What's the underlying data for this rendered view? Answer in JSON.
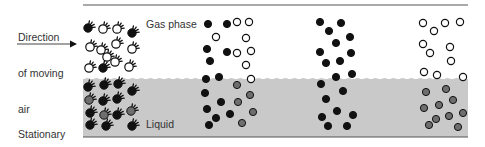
{
  "labels": {
    "direction": [
      "Direction",
      "of moving",
      "air"
    ],
    "stationary": [
      "Stationary",
      "liquid",
      "phase"
    ],
    "gas_phase": "Gas phase",
    "liquid_phase": [
      "Liquid",
      "phase"
    ]
  },
  "colors": {
    "liquid": "#c9c9c9",
    "line": "#555555",
    "filled": "#111111",
    "gray_dot": "#6e6e6e",
    "open_dot": "#ffffff"
  },
  "geometry": {
    "box_left": 83,
    "box_right": 468,
    "top_line_y": 5,
    "bottom_line_y": 137,
    "interface_y": 79
  },
  "columns": [
    {
      "name": "hydrated-molecules",
      "fuzzy": true,
      "dots": [
        {
          "x": 88,
          "y": 28,
          "t": "f"
        },
        {
          "x": 103,
          "y": 29,
          "t": "o"
        },
        {
          "x": 117,
          "y": 29,
          "t": "o"
        },
        {
          "x": 132,
          "y": 33,
          "t": "f"
        },
        {
          "x": 90,
          "y": 47,
          "t": "o"
        },
        {
          "x": 101,
          "y": 50,
          "t": "o"
        },
        {
          "x": 116,
          "y": 44,
          "t": "o"
        },
        {
          "x": 132,
          "y": 49,
          "t": "o"
        },
        {
          "x": 107,
          "y": 57,
          "t": "o"
        },
        {
          "x": 115,
          "y": 62,
          "t": "o"
        },
        {
          "x": 89,
          "y": 68,
          "t": "o"
        },
        {
          "x": 103,
          "y": 68,
          "t": "f"
        },
        {
          "x": 129,
          "y": 67,
          "t": "o"
        },
        {
          "x": 88,
          "y": 87,
          "t": "f"
        },
        {
          "x": 104,
          "y": 85,
          "t": "f"
        },
        {
          "x": 118,
          "y": 84,
          "t": "f"
        },
        {
          "x": 132,
          "y": 91,
          "t": "f"
        },
        {
          "x": 89,
          "y": 100,
          "t": "g"
        },
        {
          "x": 103,
          "y": 101,
          "t": "f"
        },
        {
          "x": 117,
          "y": 99,
          "t": "f"
        },
        {
          "x": 90,
          "y": 113,
          "t": "f"
        },
        {
          "x": 104,
          "y": 115,
          "t": "g"
        },
        {
          "x": 117,
          "y": 115,
          "t": "f"
        },
        {
          "x": 131,
          "y": 111,
          "t": "g"
        },
        {
          "x": 90,
          "y": 125,
          "t": "f"
        },
        {
          "x": 106,
          "y": 126,
          "t": "f"
        },
        {
          "x": 132,
          "y": 126,
          "t": "f"
        }
      ]
    },
    {
      "name": "mixed-column",
      "fuzzy": false,
      "dots": [
        {
          "x": 208,
          "y": 24,
          "t": "f"
        },
        {
          "x": 227,
          "y": 24,
          "t": "f"
        },
        {
          "x": 237,
          "y": 22,
          "t": "o"
        },
        {
          "x": 249,
          "y": 22,
          "t": "o"
        },
        {
          "x": 216,
          "y": 37,
          "t": "o"
        },
        {
          "x": 246,
          "y": 38,
          "t": "o"
        },
        {
          "x": 207,
          "y": 49,
          "t": "f"
        },
        {
          "x": 227,
          "y": 52,
          "t": "f"
        },
        {
          "x": 237,
          "y": 53,
          "t": "o"
        },
        {
          "x": 251,
          "y": 51,
          "t": "o"
        },
        {
          "x": 210,
          "y": 61,
          "t": "f"
        },
        {
          "x": 246,
          "y": 65,
          "t": "o"
        },
        {
          "x": 206,
          "y": 79,
          "t": "f"
        },
        {
          "x": 219,
          "y": 77,
          "t": "f"
        },
        {
          "x": 237,
          "y": 85,
          "t": "g"
        },
        {
          "x": 251,
          "y": 79,
          "t": "o"
        },
        {
          "x": 205,
          "y": 93,
          "t": "f"
        },
        {
          "x": 250,
          "y": 95,
          "t": "g"
        },
        {
          "x": 221,
          "y": 102,
          "t": "f"
        },
        {
          "x": 238,
          "y": 102,
          "t": "g"
        },
        {
          "x": 207,
          "y": 109,
          "t": "f"
        },
        {
          "x": 230,
          "y": 114,
          "t": "f"
        },
        {
          "x": 253,
          "y": 112,
          "t": "g"
        },
        {
          "x": 216,
          "y": 118,
          "t": "f"
        },
        {
          "x": 209,
          "y": 125,
          "t": "f"
        },
        {
          "x": 242,
          "y": 123,
          "t": "g"
        }
      ]
    },
    {
      "name": "filled-column",
      "fuzzy": false,
      "dots": [
        {
          "x": 320,
          "y": 22,
          "t": "f"
        },
        {
          "x": 341,
          "y": 23,
          "t": "f"
        },
        {
          "x": 329,
          "y": 31,
          "t": "f"
        },
        {
          "x": 350,
          "y": 37,
          "t": "f"
        },
        {
          "x": 336,
          "y": 43,
          "t": "f"
        },
        {
          "x": 320,
          "y": 52,
          "t": "f"
        },
        {
          "x": 351,
          "y": 53,
          "t": "f"
        },
        {
          "x": 340,
          "y": 61,
          "t": "f"
        },
        {
          "x": 326,
          "y": 63,
          "t": "f"
        },
        {
          "x": 336,
          "y": 77,
          "t": "f"
        },
        {
          "x": 352,
          "y": 74,
          "t": "f"
        },
        {
          "x": 321,
          "y": 84,
          "t": "f"
        },
        {
          "x": 343,
          "y": 91,
          "t": "f"
        },
        {
          "x": 326,
          "y": 99,
          "t": "f"
        },
        {
          "x": 337,
          "y": 111,
          "t": "f"
        },
        {
          "x": 322,
          "y": 117,
          "t": "f"
        },
        {
          "x": 353,
          "y": 115,
          "t": "f"
        },
        {
          "x": 328,
          "y": 126,
          "t": "f"
        },
        {
          "x": 347,
          "y": 126,
          "t": "f"
        }
      ]
    },
    {
      "name": "open-gray-column",
      "fuzzy": false,
      "dots": [
        {
          "x": 423,
          "y": 23,
          "t": "o"
        },
        {
          "x": 434,
          "y": 31,
          "t": "o"
        },
        {
          "x": 445,
          "y": 23,
          "t": "o"
        },
        {
          "x": 460,
          "y": 22,
          "t": "o"
        },
        {
          "x": 423,
          "y": 44,
          "t": "o"
        },
        {
          "x": 430,
          "y": 53,
          "t": "o"
        },
        {
          "x": 450,
          "y": 47,
          "t": "o"
        },
        {
          "x": 451,
          "y": 61,
          "t": "o"
        },
        {
          "x": 424,
          "y": 72,
          "t": "o"
        },
        {
          "x": 437,
          "y": 75,
          "t": "o"
        },
        {
          "x": 463,
          "y": 77,
          "t": "o"
        },
        {
          "x": 426,
          "y": 92,
          "t": "g"
        },
        {
          "x": 446,
          "y": 89,
          "t": "g"
        },
        {
          "x": 453,
          "y": 100,
          "t": "g"
        },
        {
          "x": 424,
          "y": 108,
          "t": "g"
        },
        {
          "x": 439,
          "y": 105,
          "t": "g"
        },
        {
          "x": 449,
          "y": 116,
          "t": "g"
        },
        {
          "x": 463,
          "y": 113,
          "t": "g"
        },
        {
          "x": 436,
          "y": 119,
          "t": "g"
        },
        {
          "x": 458,
          "y": 127,
          "t": "g"
        },
        {
          "x": 429,
          "y": 125,
          "t": "g"
        }
      ]
    }
  ]
}
